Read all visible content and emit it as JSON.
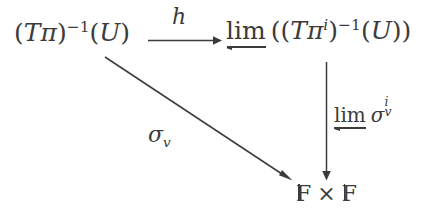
{
  "diagram": {
    "kind": "commutative-diagram",
    "background_color": "#ffffff",
    "ink_color": "#3b3b3b",
    "nodes": [
      {
        "id": "source",
        "position": "top-left",
        "latex": "(T\\pi)^{-1}(U)",
        "plain": "(Tπ)^{-1}(U)",
        "parts": {
          "open_paren": "(",
          "T": "T",
          "pi": "π",
          "close_paren": ")",
          "exponent": "−1",
          "arg_open": "(",
          "arg": "U",
          "arg_close": ")"
        }
      },
      {
        "id": "target",
        "position": "top-right",
        "latex": "\\varprojlim\\left((T\\pi^{i})^{-1}(U)\\right)",
        "plain": "lim← ((Tπ^i)^{-1}(U))",
        "parts": {
          "limit_symbol": "lim",
          "limit_direction": "left",
          "outer_open": "(",
          "open_paren": "(",
          "T": "T",
          "pi": "π",
          "pi_exponent": "i",
          "close_paren": ")",
          "exponent": "−1",
          "arg_open": "(",
          "arg": "U",
          "arg_close": ")",
          "outer_close": ")"
        }
      },
      {
        "id": "bottom",
        "position": "bottom-right",
        "latex": "\\mathbb{F}\\times\\mathbb{F}",
        "plain": "𝔽 × 𝔽",
        "parts": {
          "left_field": "F",
          "times": "×",
          "right_field": "F"
        }
      }
    ],
    "arrows": [
      {
        "id": "horizontal",
        "from": "source",
        "to": "target",
        "orientation": "horizontal",
        "label": "h",
        "label_position": "above",
        "label_style": "italic"
      },
      {
        "id": "diagonal",
        "from": "source",
        "to": "bottom",
        "orientation": "diagonal",
        "label": "σ",
        "label_subscript": "v",
        "label_plain": "σ_v",
        "label_position": "below-left"
      },
      {
        "id": "vertical",
        "from": "target",
        "to": "bottom",
        "orientation": "vertical",
        "label_limit": "lim",
        "label_limit_direction": "left",
        "label_sigma": "σ",
        "label_subscript": "v",
        "label_superscript": "i",
        "label_plain": "lim← σ_v^i",
        "label_position": "right"
      }
    ]
  }
}
